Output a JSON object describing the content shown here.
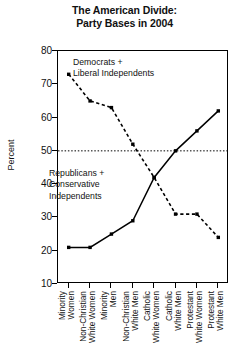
{
  "title": {
    "line1": "The American Divide:",
    "line2": "Party Bases in 2004"
  },
  "axis": {
    "ylabel": "Percent",
    "yticks": [
      "80",
      "70",
      "60",
      "50",
      "40",
      "30",
      "20",
      "10"
    ]
  },
  "annotations": {
    "democrats": [
      "Democrats +",
      "Liberal Independents"
    ],
    "republicans": [
      "Republicans +",
      "Conservative",
      "Independents"
    ]
  },
  "chart_data": {
    "type": "line",
    "title": "The American Divide: Party Bases in 2004",
    "xlabel": "",
    "ylabel": "Percent",
    "ylim": [
      10,
      80
    ],
    "ytick_step": 10,
    "grid": false,
    "legend": "inline-annotations",
    "reference_line": {
      "y": 50,
      "style": "dotted"
    },
    "categories": [
      "Minority Women",
      "Non-Christian White Women",
      "Minority Men",
      "Non-Christian White Men",
      "Catholic White Women",
      "Catholic White Men",
      "Protestant White Women",
      "Protestant White Men"
    ],
    "category_lines": [
      [
        "Minority",
        "Women"
      ],
      [
        "Non-Christian",
        "White Women"
      ],
      [
        "Minority",
        "Men"
      ],
      [
        "Non-Christian",
        "White Men"
      ],
      [
        "Catholic",
        "White Women"
      ],
      [
        "Catholic",
        "White Men"
      ],
      [
        "Protestant",
        "White Women"
      ],
      [
        "Protestant",
        "White Men"
      ]
    ],
    "series": [
      {
        "name": "Democrats + Liberal Independents",
        "style": "dashed",
        "color": "#000000",
        "values": [
          73,
          65,
          63,
          52,
          42,
          31,
          31,
          24
        ]
      },
      {
        "name": "Republicans + Conservative Independents",
        "style": "solid",
        "color": "#000000",
        "values": [
          21,
          21,
          25,
          29,
          42,
          50,
          56,
          62
        ]
      }
    ]
  }
}
